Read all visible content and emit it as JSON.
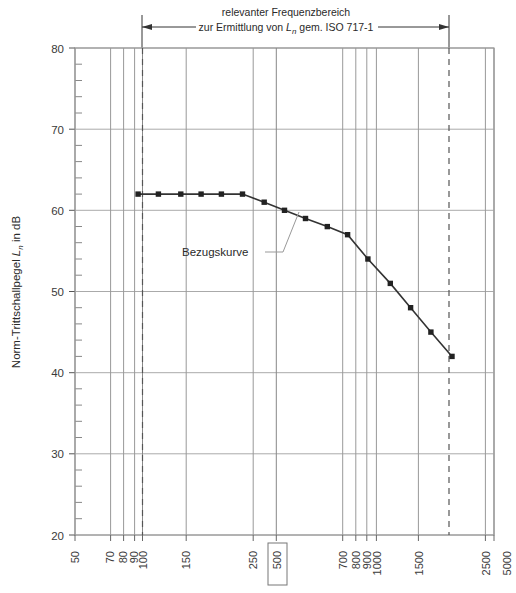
{
  "chart_data": {
    "type": "line",
    "title": "",
    "annotation_top": {
      "line1": "relevanter Frequenzbereich",
      "line2_pre": "zur Ermittlung von ",
      "line2_var": "L",
      "line2_sub": "n",
      "line2_post": " gem. ISO 717-1",
      "range_start_hz": 100,
      "range_end_hz": 3150
    },
    "series": [
      {
        "name": "Bezugskurve",
        "x": [
          100,
          125,
          160,
          200,
          250,
          315,
          400,
          500,
          630,
          800,
          1000,
          1250,
          1600,
          2000,
          2500,
          3150
        ],
        "values": [
          62,
          62,
          62,
          62,
          62,
          62,
          61,
          60,
          59,
          58,
          57,
          54,
          51,
          48,
          45,
          42
        ]
      }
    ],
    "curve_label": "Bezugskurve",
    "xlabel": "",
    "ylabel_pre": "Norm-Trittschallpegel ",
    "ylabel_var": "L",
    "ylabel_sub": "n",
    "ylabel_post": " in dB",
    "xscale": "log",
    "xlim": [
      50,
      5000
    ],
    "ylim": [
      20,
      80
    ],
    "y_major_ticks": [
      20,
      30,
      40,
      50,
      60,
      70,
      80
    ],
    "y_minor_step": 2,
    "x_tick_labels": [
      "50",
      "70",
      "80",
      "90",
      "100",
      "150",
      "250",
      "500",
      "700",
      "800",
      "900",
      "1000",
      "1500",
      "2500",
      "5000"
    ],
    "x_tick_values": [
      50,
      70,
      80,
      90,
      100,
      150,
      250,
      500,
      700,
      800,
      900,
      1000,
      1500,
      2500,
      5000
    ],
    "x_highlighted_label": "500",
    "x_gridlines": [
      50,
      70,
      80,
      90,
      100,
      150,
      250,
      500,
      700,
      800,
      900,
      1000,
      1500,
      2500,
      5000
    ],
    "dashed_verticals": [
      100,
      3150
    ],
    "grid": true,
    "legend": "none",
    "marker": "square",
    "line_color": "#333333",
    "grid_color": "#aaaaaa",
    "axis_color": "#666666"
  }
}
